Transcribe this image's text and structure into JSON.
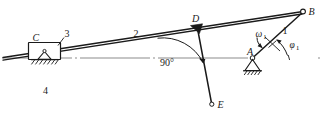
{
  "figure": {
    "type": "kinematic-mechanism-diagram",
    "background_color": "#ffffff",
    "line_color": "#1a1a1a",
    "centerline_color": "#8c8c8c"
  },
  "points": {
    "A": {
      "label": "A",
      "x": 253,
      "y": 57,
      "joint": "fixed-pivot"
    },
    "B": {
      "label": "B",
      "x": 303,
      "y": 11,
      "joint": "pin"
    },
    "C": {
      "label": "C",
      "x": 44,
      "y": 47,
      "joint": "slider"
    },
    "D": {
      "label": "D",
      "x": 196,
      "y": 28,
      "joint": "rigid"
    },
    "E": {
      "label": "E",
      "x": 212,
      "y": 104,
      "joint": "free-end"
    }
  },
  "links": {
    "link1": {
      "label": "1",
      "name": "crank-AB",
      "label_x": 285,
      "label_y": 31
    },
    "link2": {
      "label": "2",
      "name": "guide-bar-BC",
      "label_x": 136,
      "label_y": 33
    },
    "link3": {
      "label": "3",
      "name": "slider-C",
      "label_x": 67,
      "label_y": 34
    },
    "link4": {
      "label": "4",
      "name": "ground",
      "label_x": 46,
      "label_y": 91
    }
  },
  "annotations": {
    "angle_right": {
      "label": "90°",
      "x": 168,
      "y": 62
    },
    "omega": {
      "symbol": "ω",
      "subscript": "1",
      "x": 261,
      "y": 33
    },
    "phi": {
      "symbol": "φ",
      "subscript": "1",
      "x": 288,
      "y": 44
    }
  },
  "centerline": {
    "name": "horizontal-axis",
    "y": 58,
    "x_start": 2,
    "x_end": 320,
    "dash_pattern": "dash-dot"
  }
}
